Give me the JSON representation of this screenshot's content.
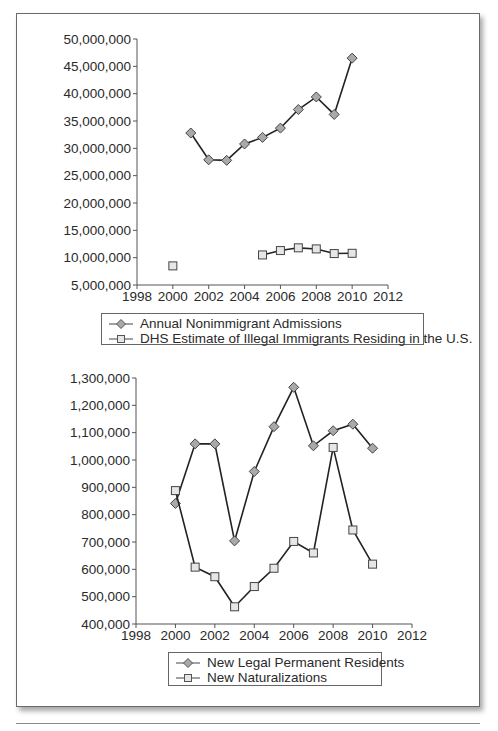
{
  "chart_data": [
    {
      "type": "line",
      "title": "",
      "xlabel": "",
      "ylabel": "",
      "x_ticks": [
        "1998",
        "2000",
        "2002",
        "2004",
        "2006",
        "2008",
        "2010",
        "2012"
      ],
      "y_ticks": [
        "5,000,000",
        "10,000,000",
        "15,000,000",
        "20,000,000",
        "25,000,000",
        "30,000,000",
        "35,000,000",
        "40,000,000",
        "45,000,000",
        "50,000,000"
      ],
      "xlim": [
        1998,
        2012
      ],
      "ylim": [
        5000000,
        50000000
      ],
      "grid": false,
      "legend_position": "below",
      "series": [
        {
          "name": "Annual Nonimmigrant Admissions",
          "marker": "diamond",
          "x": [
            2001,
            2002,
            2003,
            2004,
            2005,
            2006,
            2007,
            2008,
            2009,
            2010
          ],
          "values": [
            32800000,
            27900000,
            27800000,
            30800000,
            32000000,
            33700000,
            37100000,
            39400000,
            36200000,
            46500000
          ]
        },
        {
          "name": "DHS Estimate of Illegal Immigrants Residing in the U.S.",
          "marker": "square",
          "x": [
            2000,
            2005,
            2006,
            2007,
            2008,
            2009,
            2010
          ],
          "values": [
            8500000,
            10500000,
            11300000,
            11800000,
            11600000,
            10750000,
            10800000
          ],
          "segments": [
            [
              2000
            ],
            [
              2005,
              2006,
              2007,
              2008,
              2009,
              2010
            ]
          ]
        }
      ]
    },
    {
      "type": "line",
      "title": "",
      "xlabel": "",
      "ylabel": "",
      "x_ticks": [
        "1998",
        "2000",
        "2002",
        "2004",
        "2006",
        "2008",
        "2010",
        "2012"
      ],
      "y_ticks": [
        "400,000",
        "500,000",
        "600,000",
        "700,000",
        "800,000",
        "900,000",
        "1,000,000",
        "1,100,000",
        "1,200,000",
        "1,300,000"
      ],
      "xlim": [
        1998,
        2012
      ],
      "ylim": [
        400000,
        1300000
      ],
      "grid": false,
      "legend_position": "below",
      "series": [
        {
          "name": "New Legal Permanent Residents",
          "marker": "diamond",
          "x": [
            2000,
            2001,
            2002,
            2003,
            2004,
            2005,
            2006,
            2007,
            2008,
            2009,
            2010
          ],
          "values": [
            841000,
            1059000,
            1059000,
            704000,
            958000,
            1122000,
            1266000,
            1052000,
            1107000,
            1131000,
            1043000
          ]
        },
        {
          "name": "New Naturalizations",
          "marker": "square",
          "x": [
            2000,
            2001,
            2002,
            2003,
            2004,
            2005,
            2006,
            2007,
            2008,
            2009,
            2010
          ],
          "values": [
            888000,
            608000,
            573000,
            463000,
            537000,
            604000,
            702000,
            660000,
            1046000,
            744000,
            619000
          ]
        }
      ]
    }
  ],
  "legends": {
    "top": [
      "Annual Nonimmigrant Admissions",
      "DHS Estimate of Illegal Immigrants Residing in the U.S."
    ],
    "bottom": [
      "New Legal Permanent Residents",
      "New Naturalizations"
    ]
  },
  "colors": {
    "line": "#222222",
    "diamond_fill": "#a9a9a9",
    "square_fill": "#e6e6e6",
    "marker_stroke": "#444444",
    "axis": "#555555"
  }
}
